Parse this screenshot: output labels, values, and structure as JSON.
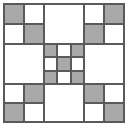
{
  "figure": {
    "title": "Quilt Block Pattern",
    "width_px": 132,
    "height_px": 130
  },
  "colors": {
    "patch_gray": "#a8a8a8",
    "patch_white": "#ffffff",
    "outline": "#5a5a5a",
    "background": "#ffffff"
  },
  "grid": {
    "frame": {
      "left": 3,
      "top": 3,
      "width": 122,
      "height": 120
    },
    "columns": [
      {
        "name": "left",
        "left": 4,
        "width": 40
      },
      {
        "name": "center",
        "left": 44,
        "width": 40
      },
      {
        "name": "right",
        "left": 84,
        "width": 40
      }
    ],
    "rows": [
      {
        "name": "top",
        "top": 4,
        "height": 40
      },
      {
        "name": "middle",
        "top": 44,
        "height": 40
      },
      {
        "name": "bottom",
        "top": 84,
        "height": 38
      }
    ]
  },
  "blocks": {
    "top_left": {
      "name": "four-patch",
      "cells": [
        "gray",
        "white",
        "white",
        "gray"
      ]
    },
    "top_center": {
      "name": "plain",
      "fill": "white"
    },
    "top_right": {
      "name": "four-patch",
      "cells": [
        "white",
        "gray",
        "gray",
        "white"
      ]
    },
    "middle_left": {
      "name": "plain",
      "fill": "white"
    },
    "center": {
      "name": "nine-patch",
      "cells": [
        "gray",
        "white",
        "gray",
        "white",
        "gray",
        "white",
        "gray",
        "white",
        "gray"
      ]
    },
    "middle_right": {
      "name": "plain",
      "fill": "white"
    },
    "bottom_left": {
      "name": "four-patch",
      "cells": [
        "white",
        "gray",
        "gray",
        "white"
      ]
    },
    "bottom_center": {
      "name": "plain",
      "fill": "white"
    },
    "bottom_right": {
      "name": "four-patch",
      "cells": [
        "gray",
        "white",
        "white",
        "gray"
      ]
    }
  }
}
